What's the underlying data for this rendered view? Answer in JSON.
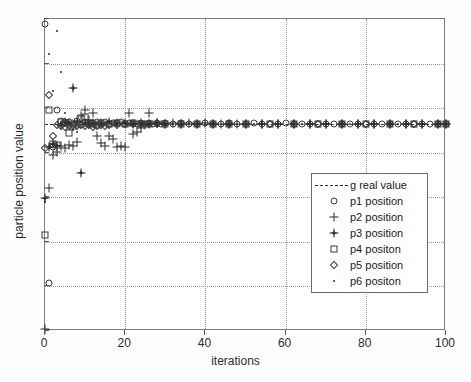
{
  "chart_data": {
    "type": "scatter",
    "title": "",
    "xlabel": "iterations",
    "ylabel": "particle position value",
    "xlim": [
      0,
      100
    ],
    "ylim": [
      0,
      7
    ],
    "xticks": [
      0,
      20,
      40,
      60,
      80,
      100
    ],
    "yticks": [
      0,
      1,
      2,
      3,
      4,
      5,
      6,
      7
    ],
    "grid": "dotted",
    "legend_position": "center-right",
    "g_real_value": 4.65,
    "series": [
      {
        "name": "g real value",
        "marker": "dashdot-line",
        "type": "hline",
        "value": 4.65
      },
      {
        "name": "p1 position",
        "marker": "circle",
        "x": [
          0,
          1,
          2,
          3,
          4,
          5,
          6,
          7,
          8,
          9,
          10,
          11,
          12,
          13,
          14,
          15,
          16,
          17,
          18,
          19,
          20,
          21,
          22,
          23,
          24,
          25,
          26,
          27,
          28,
          29,
          30,
          32,
          34,
          36,
          38,
          40,
          42,
          44,
          46,
          48,
          50,
          52,
          54,
          56,
          58,
          60,
          62,
          64,
          66,
          68,
          70,
          72,
          74,
          76,
          78,
          80,
          82,
          84,
          86,
          88,
          90,
          92,
          94,
          96,
          98,
          100
        ],
        "y": [
          6.88,
          1.08,
          4.12,
          4.95,
          4.72,
          4.68,
          4.7,
          4.66,
          4.72,
          4.62,
          4.68,
          4.64,
          4.66,
          4.7,
          4.66,
          4.68,
          4.64,
          4.66,
          4.66,
          4.68,
          4.64,
          4.66,
          4.66,
          4.65,
          4.66,
          4.65,
          4.66,
          4.65,
          4.66,
          4.65,
          4.66,
          4.65,
          4.66,
          4.65,
          4.65,
          4.66,
          4.65,
          4.65,
          4.66,
          4.65,
          4.65,
          4.66,
          4.65,
          4.65,
          4.65,
          4.66,
          4.65,
          4.65,
          4.65,
          4.65,
          4.65,
          4.65,
          4.65,
          4.65,
          4.65,
          4.65,
          4.65,
          4.65,
          4.65,
          4.65,
          4.65,
          4.65,
          4.65,
          4.65,
          4.65,
          4.65
        ]
      },
      {
        "name": "p2 position",
        "marker": "plus",
        "x": [
          0,
          1,
          2,
          3,
          4,
          5,
          6,
          7,
          8,
          9,
          10,
          11,
          12,
          13,
          14,
          15,
          16,
          17,
          18,
          19,
          20,
          21,
          22,
          23,
          24,
          25,
          26,
          28,
          30,
          32,
          34,
          36,
          38,
          40,
          42,
          44,
          46,
          48,
          50,
          54,
          58,
          62,
          66,
          70,
          74,
          78,
          82,
          86,
          90,
          94,
          98,
          100
        ],
        "y": [
          0.05,
          3.2,
          3.95,
          4.02,
          4.16,
          4.1,
          4.18,
          4.14,
          4.24,
          4.82,
          4.95,
          4.74,
          4.88,
          4.38,
          4.22,
          4.15,
          4.38,
          4.3,
          4.12,
          4.14,
          4.12,
          4.9,
          4.42,
          4.46,
          4.55,
          4.62,
          4.9,
          4.66,
          4.64,
          4.66,
          4.65,
          4.66,
          4.65,
          4.66,
          4.65,
          4.65,
          4.65,
          4.65,
          4.65,
          4.65,
          4.65,
          4.65,
          4.65,
          4.65,
          4.65,
          4.65,
          4.65,
          4.65,
          4.65,
          4.65,
          4.65,
          4.65
        ]
      },
      {
        "name": "p3 position",
        "marker": "star",
        "x": [
          0,
          1,
          2,
          3,
          4,
          5,
          6,
          7,
          8,
          9,
          10,
          11,
          12,
          14,
          16,
          18,
          20,
          22,
          24,
          26,
          28,
          30,
          34,
          38,
          42,
          46,
          50,
          54,
          58,
          62,
          66,
          70,
          74,
          78,
          82,
          86,
          90,
          94,
          98,
          100
        ],
        "y": [
          2.98,
          4.12,
          4.2,
          4.16,
          4.62,
          4.68,
          4.66,
          5.45,
          4.7,
          3.55,
          4.66,
          4.65,
          4.66,
          4.66,
          4.7,
          4.66,
          4.66,
          4.65,
          4.66,
          4.65,
          4.66,
          4.65,
          4.65,
          4.65,
          4.65,
          4.65,
          4.65,
          4.65,
          4.65,
          4.65,
          4.65,
          4.65,
          4.65,
          4.65,
          4.65,
          4.65,
          4.65,
          4.65,
          4.65,
          4.65
        ]
      },
      {
        "name": "p4 positon",
        "marker": "square",
        "x": [
          0,
          1,
          2,
          3,
          4,
          5,
          6,
          7,
          8,
          9,
          10,
          11,
          12,
          13,
          14,
          16,
          18,
          20,
          22,
          24,
          26,
          30,
          34,
          38,
          42,
          46,
          50,
          56,
          62,
          68,
          74,
          80,
          86,
          92,
          98,
          100
        ],
        "y": [
          2.15,
          4.95,
          4.2,
          4.18,
          4.68,
          4.66,
          4.45,
          4.6,
          4.65,
          4.78,
          4.8,
          4.66,
          4.65,
          4.62,
          4.66,
          4.65,
          4.66,
          4.65,
          4.66,
          4.65,
          4.65,
          4.65,
          4.65,
          4.65,
          4.65,
          4.65,
          4.65,
          4.65,
          4.65,
          4.65,
          4.65,
          4.65,
          4.65,
          4.65,
          4.65,
          4.65
        ]
      },
      {
        "name": "p5 position",
        "marker": "diamond",
        "x": [
          0,
          1,
          2,
          3,
          4,
          5,
          6,
          7,
          8,
          9,
          10,
          11,
          12,
          13,
          14,
          15,
          16,
          18,
          20,
          22,
          24,
          26,
          28,
          30,
          34,
          38,
          42,
          46,
          50,
          56,
          62,
          68,
          74,
          80,
          86,
          92,
          98,
          100
        ],
        "y": [
          4.1,
          5.3,
          4.38,
          4.62,
          4.6,
          4.58,
          4.6,
          4.62,
          4.6,
          4.62,
          4.6,
          4.62,
          4.58,
          4.6,
          4.62,
          4.6,
          4.62,
          4.62,
          4.64,
          4.65,
          4.65,
          4.65,
          4.65,
          4.65,
          4.65,
          4.65,
          4.65,
          4.65,
          4.65,
          4.65,
          4.65,
          4.65,
          4.65,
          4.65,
          4.65,
          4.65,
          4.65,
          4.65
        ]
      },
      {
        "name": "p6 positon",
        "marker": "dot",
        "x": [
          0,
          1,
          2,
          3,
          4,
          5,
          6,
          7,
          8,
          9,
          10,
          12,
          14,
          16,
          18,
          20,
          24,
          28,
          32,
          36,
          40,
          46,
          52,
          58,
          64,
          70,
          76,
          82,
          88,
          94,
          100
        ],
        "y": [
          2.9,
          6.22,
          5.38,
          6.72,
          5.82,
          4.88,
          4.7,
          4.52,
          4.46,
          4.7,
          4.66,
          4.66,
          4.65,
          4.66,
          4.65,
          4.66,
          4.65,
          4.65,
          4.65,
          4.65,
          4.65,
          4.65,
          4.65,
          4.65,
          4.65,
          4.65,
          4.65,
          4.65,
          4.65,
          4.65,
          4.65
        ]
      }
    ]
  },
  "legend": {
    "items": [
      {
        "label": "g real value",
        "marker": "dashdot-line"
      },
      {
        "label": "p1 position",
        "marker": "circle"
      },
      {
        "label": "p2 position",
        "marker": "plus"
      },
      {
        "label": "p3 position",
        "marker": "star"
      },
      {
        "label": "p4 positon",
        "marker": "square"
      },
      {
        "label": "p5 position",
        "marker": "diamond"
      },
      {
        "label": "p6 positon",
        "marker": "dot"
      }
    ]
  },
  "colors": {
    "marker": "#2b2b2b",
    "axis": "#7d7d7d",
    "grid": "#9a9a9a",
    "background": "#ffffff"
  }
}
